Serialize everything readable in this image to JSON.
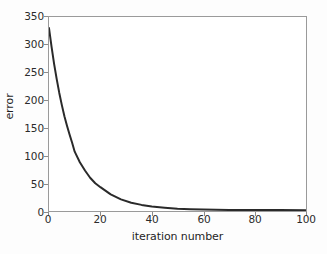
{
  "chart_data": {
    "type": "line",
    "title": "",
    "xlabel": "iteration number",
    "ylabel": "error",
    "xlim": [
      0,
      100
    ],
    "ylim": [
      0,
      350
    ],
    "xticks": [
      0,
      20,
      40,
      60,
      80,
      100
    ],
    "yticks": [
      0,
      50,
      100,
      150,
      200,
      250,
      300,
      350
    ],
    "xticklabels": [
      "0",
      "20",
      "40",
      "60",
      "80",
      "100"
    ],
    "yticklabels": [
      "0",
      "50",
      "100",
      "150",
      "200",
      "250",
      "300",
      "350"
    ],
    "grid": false,
    "legend": null,
    "line_color": "#2a2a2a",
    "line_width": 2,
    "series": [
      {
        "name": "error",
        "x": [
          0,
          1,
          2,
          3,
          4,
          5,
          6,
          7,
          8,
          9,
          10,
          12,
          14,
          16,
          18,
          20,
          24,
          28,
          32,
          36,
          40,
          45,
          50,
          55,
          60,
          70,
          80,
          90,
          100
        ],
        "values": [
          330,
          296,
          265,
          238,
          213,
          191,
          171,
          154,
          138,
          123,
          107,
          88,
          73,
          60,
          50,
          43,
          30,
          21,
          15,
          11,
          8,
          6,
          4,
          3,
          2.5,
          2,
          1.8,
          1.6,
          1.5
        ]
      }
    ]
  },
  "axes": {
    "frame_color": "#9a9a9a",
    "background": "#ffffff"
  },
  "figure": {
    "background": "#fdfdfd"
  }
}
